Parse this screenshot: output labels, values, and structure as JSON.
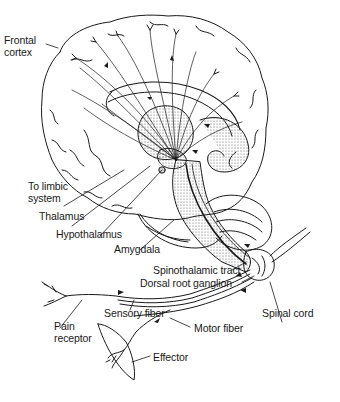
{
  "diagram": {
    "labels": {
      "frontal_cortex": [
        "Frontal",
        "cortex"
      ],
      "to_limbic_system": [
        "To limbic",
        "system"
      ],
      "thalamus": "Thalamus",
      "hypothalamus": "Hypothalamus",
      "amygdala": "Amygdala",
      "spinothalamic_tract": "Spinothalamic tract",
      "dorsal_root_ganglion": "Dorsal root ganglion",
      "sensory_fiber": "Sensory fiber",
      "spinal_cord": "Spinal cord",
      "pain_receptor": [
        "Pain",
        "receptor"
      ],
      "motor_fiber": "Motor fiber",
      "effector": "Effector"
    },
    "colors": {
      "ink": "#1a1a1a",
      "stipple": "#cfcfcf",
      "background": "#ffffff"
    }
  }
}
